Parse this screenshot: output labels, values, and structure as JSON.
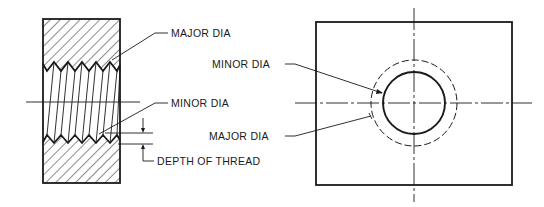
{
  "figure": {
    "section_view": {
      "labels": {
        "major_dia": "MAJOR DIA",
        "minor_dia": "MINOR DIA",
        "depth_of_thread": "DEPTH OF THREAD"
      }
    },
    "end_view": {
      "labels": {
        "minor_dia": "MINOR DIA",
        "major_dia": "MAJOR DIA"
      }
    },
    "colors": {
      "ink": "#1a1a1a",
      "background": "#ffffff"
    }
  }
}
